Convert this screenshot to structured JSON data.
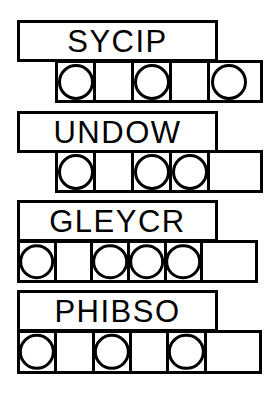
{
  "canvas": {
    "width": 279,
    "height": 396,
    "background": "#ffffff",
    "stroke_color": "#000000",
    "stroke_width": 3
  },
  "puzzle": {
    "title": "word-and-circle-grid-puzzle",
    "rows": [
      {
        "id": "row-1",
        "word": "SYCIP",
        "letter_count": 5,
        "word_box": {
          "x": 17,
          "y": 20,
          "width": 201,
          "height": 42
        },
        "cell_row": {
          "x": 55,
          "y": 60,
          "width": 208,
          "height": 43,
          "cells": 5
        },
        "circles": [
          true,
          false,
          true,
          false,
          true
        ],
        "circle_indices": [
          1,
          3,
          5
        ]
      },
      {
        "id": "row-2",
        "word": "UNDOW",
        "letter_count": 5,
        "word_box": {
          "x": 17,
          "y": 111,
          "width": 201,
          "height": 42
        },
        "cell_row": {
          "x": 55,
          "y": 150,
          "width": 208,
          "height": 43,
          "cells": 5
        },
        "circles": [
          true,
          false,
          true,
          true,
          false
        ],
        "circle_indices": [
          1,
          3,
          4
        ]
      },
      {
        "id": "row-3",
        "word": "GLEYCR",
        "letter_count": 6,
        "word_box": {
          "x": 17,
          "y": 200,
          "width": 201,
          "height": 42
        },
        "cell_row": {
          "x": 17,
          "y": 240,
          "width": 241,
          "height": 43,
          "cells": 6
        },
        "circles": [
          true,
          false,
          true,
          true,
          true,
          false
        ],
        "circle_indices": [
          1,
          3,
          4,
          5
        ]
      },
      {
        "id": "row-4",
        "word": "PHIBSO",
        "letter_count": 6,
        "word_box": {
          "x": 17,
          "y": 290,
          "width": 201,
          "height": 42
        },
        "cell_row": {
          "x": 17,
          "y": 330,
          "width": 245,
          "height": 44,
          "cells": 6
        },
        "circles": [
          true,
          false,
          true,
          false,
          true,
          false
        ],
        "circle_indices": [
          1,
          3,
          5
        ]
      }
    ]
  }
}
